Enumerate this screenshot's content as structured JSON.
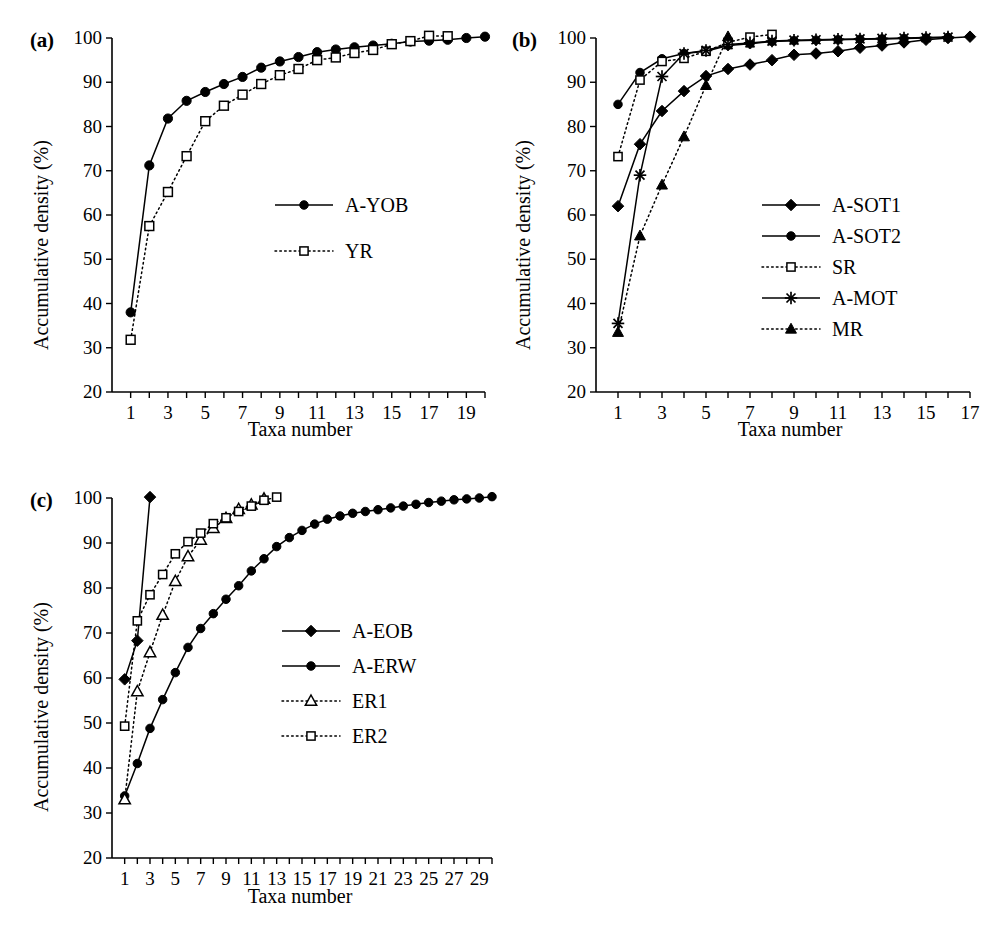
{
  "figure": {
    "axis_y_title": "Accumulative density (%)",
    "axis_x_title": "Taxa number",
    "panel_labels": {
      "a": "(a)",
      "b": "(b)",
      "c": "(c)"
    }
  },
  "chart_data": [
    {
      "id": "panel-a",
      "type": "line",
      "title": "(a)",
      "xlabel": "Taxa number",
      "ylabel": "Accumulative density (%)",
      "xlim": [
        0,
        20
      ],
      "ylim": [
        20,
        100
      ],
      "yticks": [
        20,
        30,
        40,
        50,
        60,
        70,
        80,
        90,
        100
      ],
      "xticks": [
        1,
        3,
        5,
        7,
        9,
        11,
        13,
        15,
        17,
        19
      ],
      "xticks_minor": [
        2,
        4,
        6,
        8,
        10,
        12,
        14,
        16,
        18,
        20
      ],
      "grid": false,
      "legend_position": "center-right",
      "series": [
        {
          "name": "A-YOB",
          "marker": "filled-circle",
          "line": "solid",
          "x": [
            1,
            2,
            3,
            4,
            5,
            6,
            7,
            8,
            9,
            10,
            11,
            12,
            13,
            14,
            15,
            16,
            17,
            18,
            19,
            20
          ],
          "values": [
            38.0,
            71.2,
            81.8,
            85.8,
            87.8,
            89.6,
            91.2,
            93.3,
            94.7,
            95.7,
            96.8,
            97.4,
            97.9,
            98.3,
            98.7,
            99.2,
            99.4,
            99.6,
            100.0,
            100.3
          ]
        },
        {
          "name": "YR",
          "marker": "open-square",
          "line": "dotted",
          "x": [
            1,
            2,
            3,
            4,
            5,
            6,
            7,
            8,
            9,
            10,
            11,
            12,
            13,
            14,
            15,
            16,
            17,
            18
          ],
          "values": [
            31.8,
            57.5,
            65.2,
            73.3,
            81.2,
            84.7,
            87.2,
            89.6,
            91.6,
            93.0,
            95.0,
            95.6,
            96.6,
            97.3,
            98.6,
            99.3,
            100.5,
            100.4
          ]
        }
      ]
    },
    {
      "id": "panel-b",
      "type": "line",
      "title": "(b)",
      "xlabel": "Taxa number",
      "ylabel": "Accumulative density (%)",
      "xlim": [
        0,
        17
      ],
      "ylim": [
        20,
        100
      ],
      "yticks": [
        20,
        30,
        40,
        50,
        60,
        70,
        80,
        90,
        100
      ],
      "xticks": [
        1,
        3,
        5,
        7,
        9,
        11,
        13,
        15,
        17
      ],
      "xticks_minor": [
        2,
        4,
        6,
        8,
        10,
        12,
        14,
        16
      ],
      "grid": false,
      "legend_position": "center-right",
      "series": [
        {
          "name": "A-SOT1",
          "marker": "filled-diamond",
          "line": "solid",
          "x": [
            1,
            2,
            3,
            4,
            5,
            6,
            7,
            8,
            9,
            10,
            11,
            12,
            13,
            14,
            15,
            16,
            17
          ],
          "values": [
            62.0,
            76.0,
            83.5,
            88.0,
            91.4,
            93.0,
            94.0,
            95.0,
            96.2,
            96.5,
            97.0,
            97.8,
            98.3,
            99.0,
            99.6,
            100.0,
            100.3
          ]
        },
        {
          "name": "A-SOT2",
          "marker": "filled-circle",
          "line": "solid",
          "x": [
            1,
            2,
            3,
            4,
            5,
            6,
            7,
            8,
            9,
            10,
            11,
            12,
            13,
            14,
            15,
            16
          ],
          "values": [
            85.0,
            92.2,
            95.3,
            96.5,
            97.0,
            98.3,
            98.7,
            99.2,
            99.4,
            99.5,
            99.6,
            99.7,
            99.8,
            99.9,
            100.0,
            100.1
          ]
        },
        {
          "name": "SR",
          "marker": "open-square",
          "line": "dotted",
          "x": [
            1,
            2,
            3,
            4,
            5,
            6,
            7,
            8
          ],
          "values": [
            73.2,
            90.5,
            94.7,
            95.4,
            97.0,
            99.0,
            100.2,
            100.8
          ]
        },
        {
          "name": "A-MOT",
          "marker": "star",
          "line": "solid",
          "x": [
            1,
            2,
            3,
            4,
            5,
            6,
            7,
            8,
            9,
            10,
            11,
            12,
            13,
            14,
            15,
            16
          ],
          "values": [
            35.5,
            69.0,
            91.3,
            96.5,
            97.2,
            98.5,
            98.9,
            99.3,
            99.5,
            99.6,
            99.7,
            99.8,
            99.9,
            100.0,
            100.1,
            100.2
          ]
        },
        {
          "name": "MR",
          "marker": "filled-triangle",
          "line": "dotted",
          "x": [
            1,
            2,
            3,
            4,
            5,
            6
          ],
          "values": [
            33.5,
            55.3,
            66.8,
            77.7,
            89.3,
            100.3
          ]
        }
      ]
    },
    {
      "id": "panel-c",
      "type": "line",
      "title": "(c)",
      "xlabel": "Taxa number",
      "ylabel": "Accumulative density (%)",
      "xlim": [
        0,
        30
      ],
      "ylim": [
        20,
        100
      ],
      "yticks": [
        20,
        30,
        40,
        50,
        60,
        70,
        80,
        90,
        100
      ],
      "xticks": [
        1,
        3,
        5,
        7,
        9,
        11,
        13,
        15,
        17,
        19,
        21,
        23,
        25,
        27,
        29
      ],
      "xticks_minor": [
        2,
        4,
        6,
        8,
        10,
        12,
        14,
        16,
        18,
        20,
        22,
        24,
        26,
        28,
        30
      ],
      "grid": false,
      "legend_position": "center-right",
      "series": [
        {
          "name": "A-EOB",
          "marker": "filled-diamond",
          "line": "solid",
          "x": [
            1,
            2,
            3
          ],
          "values": [
            59.7,
            68.3,
            100.2
          ]
        },
        {
          "name": "A-ERW",
          "marker": "filled-circle",
          "line": "solid",
          "x": [
            1,
            2,
            3,
            4,
            5,
            6,
            7,
            8,
            9,
            10,
            11,
            12,
            13,
            14,
            15,
            16,
            17,
            18,
            19,
            20,
            21,
            22,
            23,
            24,
            25,
            26,
            27,
            28,
            29,
            30
          ],
          "values": [
            33.8,
            41.0,
            48.8,
            55.2,
            61.2,
            66.8,
            71.0,
            74.3,
            77.5,
            80.5,
            83.8,
            86.5,
            89.2,
            91.2,
            92.8,
            94.2,
            95.3,
            96.0,
            96.6,
            97.0,
            97.4,
            97.8,
            98.2,
            98.6,
            99.0,
            99.3,
            99.6,
            99.8,
            100.0,
            100.3
          ]
        },
        {
          "name": "ER1",
          "marker": "open-triangle",
          "line": "dotted",
          "x": [
            1,
            2,
            3,
            4,
            5,
            6,
            7,
            8,
            9,
            10,
            11,
            12
          ],
          "values": [
            33.0,
            57.0,
            65.7,
            74.0,
            81.5,
            87.0,
            90.7,
            93.3,
            95.5,
            97.5,
            98.5,
            99.8
          ]
        },
        {
          "name": "ER2",
          "marker": "open-square",
          "line": "dotted",
          "x": [
            1,
            2,
            3,
            4,
            5,
            6,
            7,
            8,
            9,
            10,
            11,
            12,
            13
          ],
          "values": [
            49.3,
            72.7,
            78.5,
            83.0,
            87.6,
            90.3,
            92.2,
            94.3,
            95.6,
            97.0,
            98.2,
            99.5,
            100.2
          ]
        }
      ]
    }
  ]
}
